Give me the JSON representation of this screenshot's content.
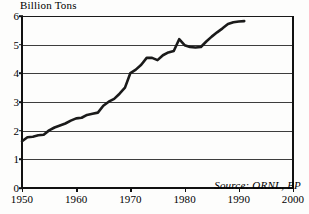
{
  "chart_data": {
    "type": "line",
    "title": "",
    "ylabel": "Billion Tons",
    "xlabel": "",
    "xlim": [
      1950,
      2000
    ],
    "ylim": [
      0,
      6
    ],
    "grid": true,
    "legend": "none",
    "annotation": "Source: ORNL, BP",
    "x_ticks": [
      1950,
      1960,
      1970,
      1980,
      1990,
      2000
    ],
    "y_ticks": [
      0,
      1,
      2,
      3,
      4,
      5,
      6
    ],
    "series": [
      {
        "name": "Carbon Emissions",
        "color": "#1a1a1a",
        "x": [
          1950,
          1951,
          1952,
          1953,
          1954,
          1955,
          1956,
          1957,
          1958,
          1959,
          1960,
          1961,
          1962,
          1963,
          1964,
          1965,
          1966,
          1967,
          1968,
          1969,
          1970,
          1971,
          1972,
          1973,
          1974,
          1975,
          1976,
          1977,
          1978,
          1979,
          1980,
          1981,
          1982,
          1983,
          1984,
          1985,
          1986,
          1987,
          1988,
          1989,
          1990,
          1991
        ],
        "values": [
          1.63,
          1.77,
          1.79,
          1.84,
          1.86,
          2.01,
          2.11,
          2.18,
          2.25,
          2.35,
          2.43,
          2.45,
          2.55,
          2.59,
          2.63,
          2.87,
          3.01,
          3.11,
          3.29,
          3.5,
          4.01,
          4.13,
          4.3,
          4.54,
          4.54,
          4.46,
          4.63,
          4.73,
          4.78,
          5.19,
          4.98,
          4.92,
          4.9,
          4.92,
          5.11,
          5.28,
          5.43,
          5.57,
          5.72,
          5.78,
          5.81,
          5.82
        ]
      }
    ]
  },
  "axis": {
    "y_title": "Billion Tons",
    "y_labels": [
      "6",
      "5",
      "4",
      "3",
      "2",
      "1",
      "0"
    ],
    "x_labels": [
      "1950",
      "1960",
      "1970",
      "1980",
      "1990",
      "2000"
    ]
  },
  "source": {
    "text": "Source: ORNL, BP"
  }
}
